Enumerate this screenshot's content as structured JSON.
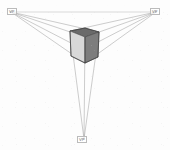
{
  "diagram": {
    "type": "perspective-construction",
    "canvas": {
      "width": 170,
      "height": 150,
      "background": "#fdfdfd"
    },
    "colors": {
      "construction_line": "#8f8f8f",
      "horizon_line": "#9a9a9a",
      "cube_outline": "#4a4a4a",
      "face_left": "#d8d8d8",
      "face_right": "#7d7d7d",
      "face_top": "#6a6a6a",
      "label_text": "#6d6d6d"
    },
    "vanishing_points": [
      {
        "id": "vp-left",
        "label": "VP",
        "x": 11,
        "y": 12
      },
      {
        "id": "vp-right",
        "label": "VP",
        "x": 156,
        "y": 12
      },
      {
        "id": "vp-bottom",
        "label": "VP",
        "x": 84,
        "y": 139
      }
    ],
    "horizon": {
      "x1": 11,
      "y1": 12,
      "x2": 156,
      "y2": 12
    },
    "cube": {
      "name": "shaded-cube",
      "vertices": {
        "top_front": {
          "x": 85,
          "y": 37
        },
        "top_left": {
          "x": 70,
          "y": 31
        },
        "top_right": {
          "x": 99,
          "y": 32
        },
        "top_back": {
          "x": 85,
          "y": 28
        },
        "bot_front": {
          "x": 85,
          "y": 63
        },
        "bot_left": {
          "x": 71,
          "y": 56
        },
        "bot_right": {
          "x": 98,
          "y": 57
        }
      },
      "faces": [
        {
          "id": "face-top",
          "shade": "#6a6a6a",
          "opacity": 1.0
        },
        {
          "id": "face-left",
          "shade": "#d8d8d8",
          "opacity": 1.0
        },
        {
          "id": "face-right",
          "shade": "#7d7d7d",
          "opacity": 1.0
        }
      ]
    },
    "construction_lines": {
      "to_left_vp": 4,
      "to_right_vp": 4,
      "to_bottom_vp": 3,
      "stroke_width": 0.45
    }
  }
}
